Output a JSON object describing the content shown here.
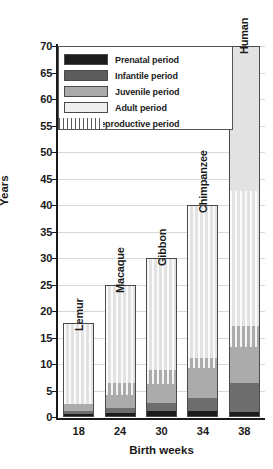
{
  "chart_data": {
    "type": "bar",
    "title": "",
    "xlabel": "Birth weeks",
    "ylabel": "Years",
    "ylim": [
      0,
      70
    ],
    "yticks": [
      0,
      5,
      10,
      15,
      20,
      25,
      30,
      35,
      40,
      45,
      50,
      55,
      60,
      65,
      70
    ],
    "grid": true,
    "stacked": true,
    "legend_position": "top-left",
    "categories": [
      "18",
      "24",
      "30",
      "34",
      "38"
    ],
    "category_names": [
      "Lemur",
      "Macaque",
      "Gibbon",
      "Chimpanzee",
      "Human"
    ],
    "series": [
      {
        "name": "Prenatal period",
        "values": [
          0.3,
          0.5,
          1.0,
          1.0,
          0.8
        ]
      },
      {
        "name": "Infantile period",
        "values": [
          0.7,
          1.0,
          1.5,
          2.4,
          5.5
        ]
      },
      {
        "name": "Juvenile period",
        "values": [
          1.2,
          4.7,
          6.1,
          7.6,
          10.7
        ]
      },
      {
        "name": "Adult period",
        "values": [
          15.5,
          18.8,
          21.4,
          29.0,
          53.0
        ]
      }
    ],
    "totals": [
      17.7,
      25.0,
      30.0,
      40.0,
      70.0
    ],
    "female_reproductive_period": [
      {
        "species": "Lemur",
        "start": 2.2,
        "end": 17.7
      },
      {
        "species": "Macaque",
        "start": 4.0,
        "end": 25.0
      },
      {
        "species": "Gibbon",
        "start": 6.0,
        "end": 30.0
      },
      {
        "species": "Chimpanzee",
        "start": 9.0,
        "end": 40.0
      },
      {
        "species": "Human",
        "start": 13.0,
        "end": 42.5
      }
    ],
    "legend": [
      {
        "key": "prenatal",
        "label": "Prenatal period"
      },
      {
        "key": "infantile",
        "label": "Infantile period"
      },
      {
        "key": "juvenile",
        "label": "Juvenile period"
      },
      {
        "key": "adult",
        "label": "Adult period"
      },
      {
        "key": "repro",
        "label": "Female reproductive period"
      }
    ],
    "colors": {
      "prenatal": "#1c1c1c",
      "infantile": "#6e6e6e",
      "juvenile": "#ababab",
      "adult": "#e2e2e2",
      "axis": "#1a1a1a",
      "grid": "#d8d8d8"
    }
  },
  "axis": {
    "y_title": "Years",
    "x_title": "Birth weeks",
    "y_tick_labels": [
      "0",
      "5",
      "10",
      "15",
      "20",
      "25",
      "30",
      "35",
      "40",
      "45",
      "50",
      "55",
      "60",
      "65",
      "70"
    ],
    "x_tick_labels": [
      "18",
      "24",
      "30",
      "34",
      "38"
    ]
  },
  "bar_labels": {
    "lemur": "Lemur",
    "macaque": "Macaque",
    "gibbon": "Gibbon",
    "chimpanzee": "Chimpanzee",
    "human": "Human"
  },
  "legend_labels": {
    "prenatal": "Prenatal period",
    "infantile": "Infantile period",
    "juvenile": "Juvenile period",
    "adult": "Adult period",
    "repro": "Female reproductive period"
  }
}
